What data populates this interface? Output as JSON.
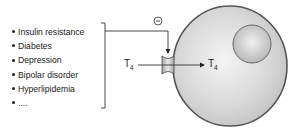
{
  "conditions_list": {
    "items": [
      "Insulin resistance",
      "Diabetes",
      "Depression",
      "Bipolar disorder",
      "Hyperlipidemia",
      "...."
    ]
  },
  "inhibition_symbol": "−",
  "t4_outside": {
    "base": "T",
    "sub": "4"
  },
  "t4_inside": {
    "base": "T",
    "sub": "4"
  },
  "colors": {
    "cell_fill": "#d6d6d6",
    "cell_border": "#555555",
    "nucleus_fill": "#c4c4c4",
    "line": "#333333"
  }
}
